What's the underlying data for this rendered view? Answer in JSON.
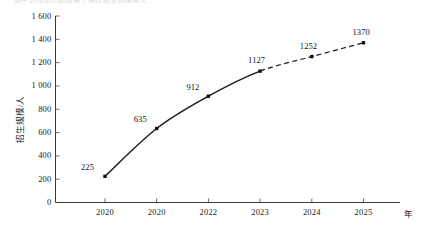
{
  "clipped_header": {
    "text": "图中折线统计图反映了某校招生规模情况"
  },
  "chart_data": {
    "type": "line",
    "title": "",
    "subtitle": "",
    "xlabel": "年",
    "ylabel": "招生规模/人",
    "categories": [
      "2020",
      "2020",
      "2022",
      "2023",
      "2024",
      "2025"
    ],
    "values": [
      225,
      635,
      912,
      1127,
      1252,
      1370
    ],
    "point_labels": [
      "225",
      "635",
      "912",
      "1127",
      "1252",
      "1370"
    ],
    "ylim": [
      0,
      1600
    ],
    "ytick_step": 200,
    "ytick_values": [
      0,
      200,
      400,
      600,
      800,
      1000,
      1200,
      1400,
      1600
    ],
    "ytick_labels": [
      "0",
      "200",
      "400",
      "600",
      "800",
      "1 000",
      "1 200",
      "1 400",
      "1 600"
    ],
    "grid": false,
    "legend": null,
    "legend_position": "none",
    "markers": "filled-square",
    "segments": [
      {
        "name": "actual",
        "style": "solid",
        "from_index": 0,
        "to_index": 3
      },
      {
        "name": "projected",
        "style": "dashed",
        "from_index": 3,
        "to_index": 5
      }
    ],
    "series": [
      {
        "name": "招生规模/人",
        "values": [
          225,
          635,
          912,
          1127,
          1252,
          1370
        ],
        "color": "#111111"
      }
    ],
    "colors": {
      "line": "#111111",
      "marker": "#111111",
      "axis": "#3a3a3a",
      "text": "#1a1a1a",
      "background": "#ffffff"
    }
  }
}
